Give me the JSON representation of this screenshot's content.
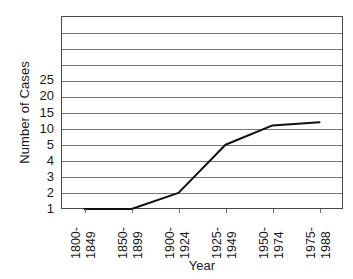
{
  "chart_data": {
    "type": "line",
    "title": "",
    "xlabel": "Year",
    "ylabel": "Number of Cases",
    "categories": [
      "1800-1849",
      "1850-1899",
      "1900-1924",
      "1925-1949",
      "1950-1974",
      "1975-1988"
    ],
    "category_lines": [
      [
        "1800-",
        "1849"
      ],
      [
        "1850-",
        "1899"
      ],
      [
        "1900-",
        "1924"
      ],
      [
        "1925-",
        "1949"
      ],
      [
        "1950-",
        "1974"
      ],
      [
        "1975-",
        "1988"
      ]
    ],
    "values": [
      1,
      1,
      2,
      5,
      11,
      12
    ],
    "series": [
      {
        "name": "Number of Cases",
        "values": [
          1,
          1,
          2,
          5,
          11,
          12
        ]
      }
    ],
    "ytick_labels": [
      "25",
      "20",
      "15",
      "10",
      "5",
      "4",
      "3",
      "2",
      "1"
    ],
    "ytick_values": [
      25,
      20,
      15,
      10,
      5,
      4,
      3,
      2,
      1
    ],
    "y_scale": "ordinal-nonlinear",
    "y_band_count": 12,
    "grid": true,
    "grid_axis": "y",
    "legend": "none",
    "colors": {
      "line": "#101010",
      "grid": "#777777",
      "frame": "#4a4a4a",
      "background": "#ffffff",
      "text": "#1a1a1a"
    }
  }
}
